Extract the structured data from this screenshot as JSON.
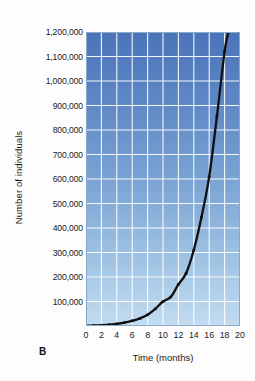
{
  "figure": {
    "panel_label": "B"
  },
  "chart_data": {
    "type": "line",
    "title": "",
    "subtitle": "",
    "xlabel": "Time (months)",
    "ylabel": "Number of individuals",
    "xlim": [
      0,
      20
    ],
    "ylim": [
      0,
      1200000
    ],
    "grid": true,
    "legend": null,
    "x_ticks": [
      0,
      2,
      4,
      6,
      8,
      10,
      12,
      14,
      16,
      18,
      20
    ],
    "x_tick_labels": [
      "0",
      "2",
      "4",
      "6",
      "8",
      "10",
      "12",
      "14",
      "16",
      "18",
      "20"
    ],
    "y_ticks": [
      100000,
      200000,
      300000,
      400000,
      500000,
      600000,
      700000,
      800000,
      900000,
      1000000,
      1100000,
      1200000
    ],
    "y_tick_labels": [
      "100,000",
      "200,000",
      "300,000",
      "400,000",
      "500,000",
      "600,000",
      "700,000",
      "800,000",
      "900,000",
      "1,000,000",
      "1,100,000",
      "1,200,000"
    ],
    "series": [
      {
        "name": "Population size",
        "marker": "dot",
        "color": "#101010",
        "x": [
          0,
          1,
          2,
          3,
          4,
          5,
          6,
          7,
          8,
          9,
          10,
          11,
          12,
          13,
          14,
          15,
          16,
          17,
          18,
          18.5
        ],
        "values": [
          1000,
          2000,
          3500,
          5500,
          9000,
          14000,
          21000,
          31000,
          46000,
          70000,
          100000,
          118000,
          170000,
          215000,
          310000,
          445000,
          610000,
          855000,
          1120000,
          1200000
        ]
      }
    ],
    "annotations": [],
    "colors": {
      "plot_bg_top": "#4a74b8",
      "plot_bg_bottom": "#c2dcf0",
      "gridline": "#ffffff",
      "curve": "#101010"
    }
  }
}
